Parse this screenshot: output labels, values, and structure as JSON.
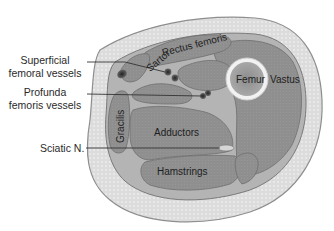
{
  "labels": {
    "superficial": [
      "Superficial",
      "femoral vessels"
    ],
    "profunda": [
      "Profunda",
      "femoris vessels"
    ],
    "sciatic": "Sciatic N."
  },
  "structures": {
    "sartorius": "Sartor",
    "rectus": "Rectus femoris",
    "femur": "Femur",
    "vastus": "Vastus",
    "gracilis": "Gracilis",
    "adductors": "Adductors",
    "hamstrings": "Hamstrings"
  },
  "colors": {
    "background": "#ffffff",
    "skin_outline": "#8e8e8e",
    "subcutaneous_fat": "#dcdcdc",
    "fascia": "#b4b4b4",
    "muscle": "#8f8f8f",
    "muscle_outline": "#6e6e6e",
    "bone_cortex": "#f2f2f2",
    "marrow": "#9a9a9a",
    "vessel": "#3a3a3a",
    "leader_line": "#333333"
  }
}
